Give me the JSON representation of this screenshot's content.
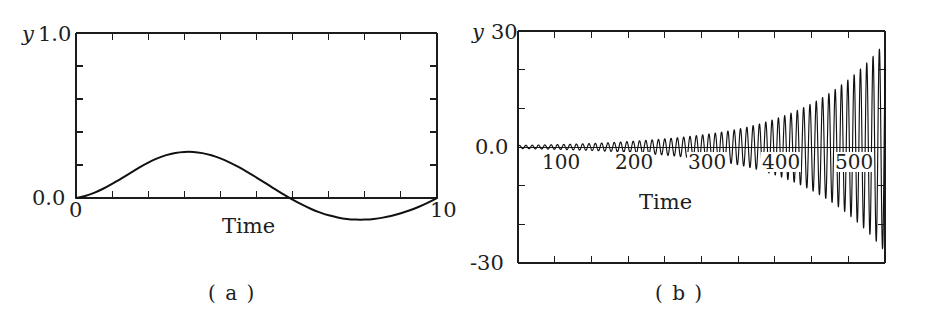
{
  "figure": {
    "panels": [
      {
        "id": "a",
        "caption": "( a )",
        "y_axis_var": "y",
        "y_top_label": "1.0",
        "y_bottom_label": "0.0",
        "x_left_label": "0",
        "x_right_label": "10",
        "x_axis_title": "Time"
      },
      {
        "id": "b",
        "caption": "( b )",
        "y_axis_var": "y",
        "y_top_label": "30",
        "y_mid_label": "0.0",
        "y_bottom_label": "-30",
        "x_axis_title": "Time",
        "x_tick_labels": [
          "100",
          "200",
          "300",
          "400",
          "500"
        ]
      }
    ]
  },
  "chart_data": [
    {
      "type": "line",
      "panel": "a",
      "title": "( a )",
      "xlabel": "Time",
      "ylabel": "y",
      "xlim": [
        0,
        10
      ],
      "ylim": [
        0.0,
        1.0
      ],
      "xticks": [
        0,
        1,
        2,
        3,
        4,
        5,
        6,
        7,
        8,
        9,
        10
      ],
      "xtick_labels": [
        "0",
        "",
        "",
        "",
        "",
        "",
        "",
        "",
        "",
        "",
        "10"
      ],
      "yticks": [
        0.0,
        0.2,
        0.4,
        0.6,
        0.8,
        1.0
      ],
      "ytick_labels": [
        "0.0",
        "",
        "",
        "",
        "",
        "1.0"
      ],
      "grid": false,
      "legend": null,
      "description": "Single slow sinusoidal oscillation starting at zero, rising to a positive peak near t=3.3, crossing zero near t=6.4, dipping to a shallower negative trough near t=8.0 and returning to zero at t=10.",
      "series": [
        {
          "name": "y(t)",
          "x": [
            0.0,
            0.25,
            0.5,
            0.75,
            1.0,
            1.25,
            1.5,
            1.75,
            2.0,
            2.25,
            2.5,
            2.75,
            3.0,
            3.25,
            3.5,
            3.75,
            4.0,
            4.25,
            4.5,
            4.75,
            5.0,
            5.25,
            5.5,
            5.75,
            6.0,
            6.25,
            6.5,
            6.75,
            7.0,
            7.25,
            7.5,
            7.75,
            8.0,
            8.25,
            8.5,
            8.75,
            9.0,
            9.25,
            9.5,
            9.75,
            10.0
          ],
          "y": [
            0.0,
            0.012,
            0.031,
            0.056,
            0.086,
            0.118,
            0.151,
            0.184,
            0.214,
            0.24,
            0.26,
            0.273,
            0.279,
            0.279,
            0.272,
            0.259,
            0.24,
            0.216,
            0.188,
            0.157,
            0.124,
            0.09,
            0.055,
            0.022,
            -0.01,
            -0.039,
            -0.065,
            -0.087,
            -0.105,
            -0.118,
            -0.127,
            -0.131,
            -0.131,
            -0.127,
            -0.119,
            -0.107,
            -0.092,
            -0.074,
            -0.053,
            -0.028,
            0.0
          ]
        }
      ]
    },
    {
      "type": "line",
      "panel": "b",
      "title": "( b )",
      "xlabel": "Time",
      "ylabel": "y",
      "xlim": [
        0,
        500
      ],
      "ylim": [
        -30,
        30
      ],
      "xticks": [
        0,
        50,
        100,
        150,
        200,
        250,
        300,
        350,
        400,
        450,
        500
      ],
      "xtick_labels": [
        "",
        "",
        "100",
        "",
        "200",
        "",
        "300",
        "",
        "400",
        "",
        "500"
      ],
      "yticks": [
        -30,
        -20,
        -10,
        0,
        10,
        20,
        30
      ],
      "ytick_labels": [
        "-30",
        "",
        "",
        "0.0",
        "",
        "",
        "30"
      ],
      "grid": false,
      "legend": null,
      "description": "Exponentially growing fast oscillation about zero. Amplitude is near 0.4 at t=0, about 1.5 at t=150, about 4 at t=300, about 11 at t=400 and reaches roughly 27 at t=500. Oscillation period is approximately 8.6 time units (about 58 cycles across the window).",
      "envelope": {
        "t": [
          0,
          50,
          100,
          150,
          200,
          250,
          300,
          350,
          400,
          450,
          500
        ],
        "amplitude": [
          0.4,
          0.6,
          0.9,
          1.4,
          2.1,
          3.1,
          4.6,
          7.2,
          11.2,
          17.4,
          27.0
        ]
      },
      "oscillation_period": 8.6
    }
  ]
}
